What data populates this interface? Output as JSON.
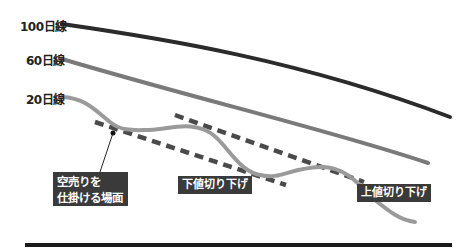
{
  "diagram": {
    "labels": {
      "ma100": "100日線",
      "ma60": "60日線",
      "ma20": "20日線"
    },
    "annotations": {
      "entry_line1": "空売りを",
      "entry_line2": "仕掛ける場面",
      "lower_trend": "下値切り下げ",
      "upper_trend": "上値切り下げ"
    },
    "colors": {
      "ma100": "#2b2b2b",
      "ma60": "#7a7a7a",
      "ma20": "#9a9a9a",
      "trendline": "#4a4a4a",
      "label_box": "#3a3a3a",
      "baseline": "#1a1a1a"
    }
  }
}
